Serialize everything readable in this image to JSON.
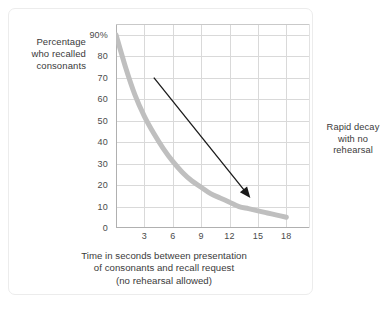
{
  "chart_data": {
    "type": "line",
    "title": "",
    "subtitle": "",
    "ylabel_lines": [
      "Percentage",
      "who recalled",
      "consonants"
    ],
    "xlabel_lines": [
      "Time in seconds between presentation",
      "of consonants and recall request",
      "(no rehearsal allowed)"
    ],
    "xlabel": "Time in seconds between presentation of consonants and recall request (no rehearsal allowed)",
    "ylabel": "Percentage who recalled consonants",
    "x": [
      0,
      1,
      2,
      3,
      4,
      5,
      6,
      7,
      8,
      9,
      10,
      11,
      12,
      13,
      14,
      15,
      16,
      17,
      18
    ],
    "values": [
      90,
      75,
      62,
      52,
      44,
      37,
      31,
      26,
      22,
      19,
      16,
      14,
      12,
      10,
      9,
      8,
      7,
      6,
      5
    ],
    "series": [
      {
        "name": "Percentage recalled",
        "values": [
          90,
          75,
          62,
          52,
          44,
          37,
          31,
          26,
          22,
          19,
          16,
          14,
          12,
          10,
          9,
          8,
          7,
          6,
          5
        ],
        "color": "#bfbfbf"
      }
    ],
    "x_ticks": [
      3,
      6,
      9,
      12,
      15,
      18
    ],
    "x_tick_labels": [
      "3",
      "6",
      "9",
      "12",
      "15",
      "18"
    ],
    "y_ticks": [
      0,
      10,
      20,
      30,
      40,
      50,
      60,
      70,
      80,
      90
    ],
    "y_tick_labels": [
      "0",
      "10",
      "20",
      "30",
      "40",
      "50",
      "60",
      "70",
      "80",
      "90%"
    ],
    "xlim": [
      0,
      20.5
    ],
    "ylim": [
      0,
      95
    ],
    "grid": true,
    "grid_color": "#d9d9d9",
    "legend": "none",
    "line_color": "#bfbfbf",
    "line_width": 5,
    "annotations": [
      {
        "text_lines": [
          "Rapid decay",
          "with no",
          "rehearsal"
        ],
        "text": "Rapid decay with no rehearsal",
        "arrow_from": [
          4.0,
          70
        ],
        "arrow_to": [
          14.2,
          14
        ],
        "arrow_color": "#1a1a1a"
      }
    ]
  },
  "axes": {
    "axis_line_color": "#b3b3b3",
    "tick_label_color": "#4a4a4a",
    "text_color": "#3a3a3a"
  },
  "frame": {
    "border_color": "#ececec",
    "background": "#ffffff"
  }
}
